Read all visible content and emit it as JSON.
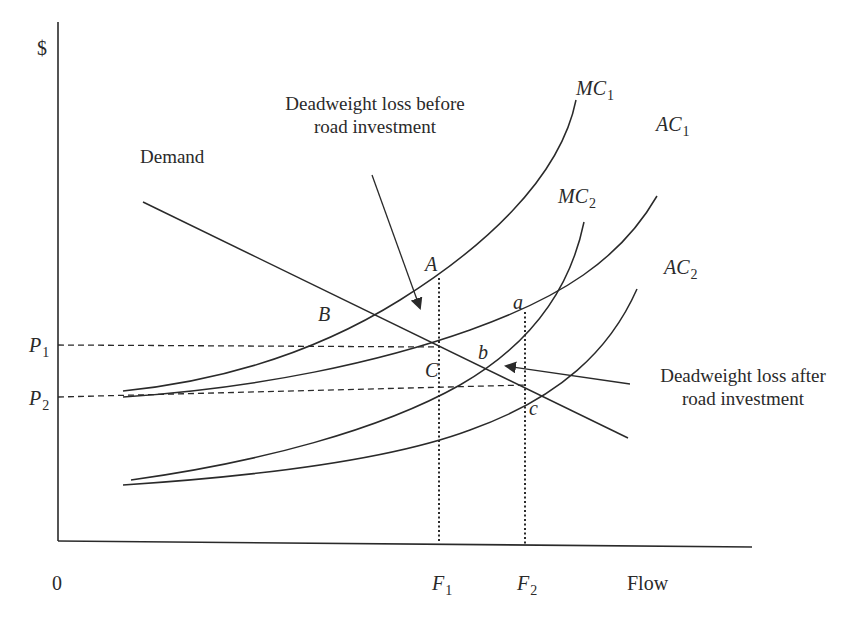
{
  "diagram": {
    "axes": {
      "y_label": "$",
      "x_label": "Flow",
      "origin_label": "0",
      "y_ticks": [
        {
          "main": "P",
          "sub": "1"
        },
        {
          "main": "P",
          "sub": "2"
        }
      ],
      "x_ticks": [
        {
          "main": "F",
          "sub": "1"
        },
        {
          "main": "F",
          "sub": "2"
        }
      ]
    },
    "curves": {
      "demand": "Demand",
      "mc1": {
        "main": "MC",
        "sub": "1"
      },
      "ac1": {
        "main": "AC",
        "sub": "1"
      },
      "mc2": {
        "main": "MC",
        "sub": "2"
      },
      "ac2": {
        "main": "AC",
        "sub": "2"
      }
    },
    "points": {
      "A": "A",
      "B": "B",
      "C": "C",
      "a": "a",
      "b": "b",
      "c": "c"
    },
    "annotations": {
      "before": {
        "line1": "Deadweight loss before",
        "line2": "road investment"
      },
      "after": {
        "line1": "Deadweight loss after",
        "line2": "road investment"
      }
    }
  },
  "colors": {
    "ink": "#2a2a2a",
    "background": "#ffffff"
  }
}
